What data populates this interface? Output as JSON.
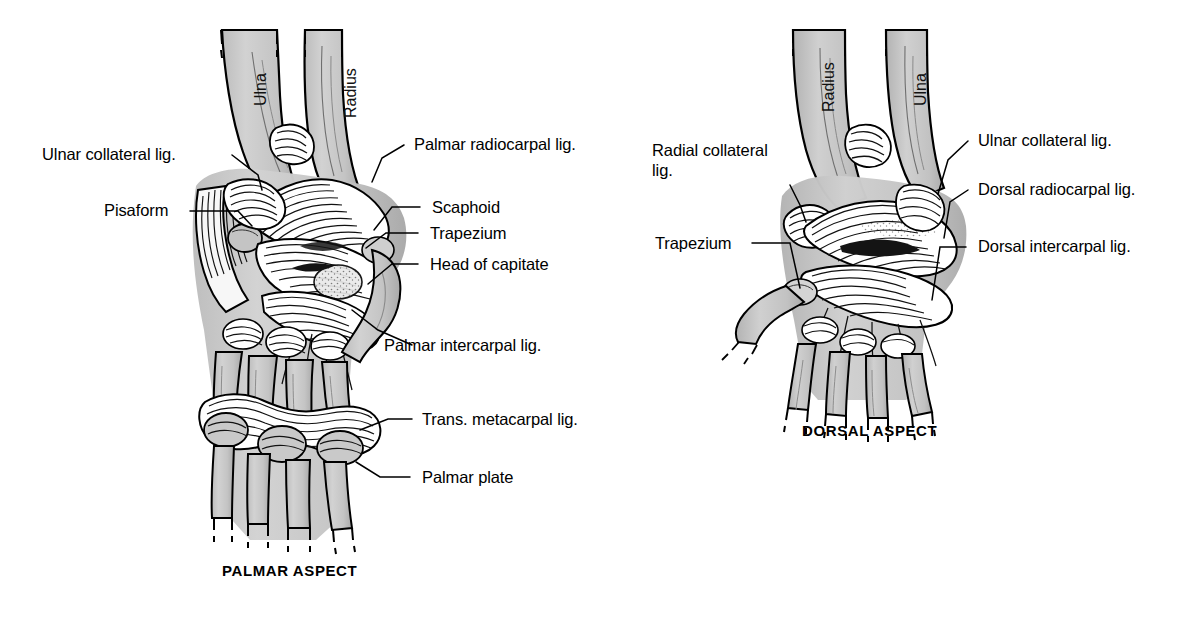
{
  "figure": {
    "background_color": "#ffffff",
    "bone_fill_color": "#c9c9c9",
    "ink_color": "#000000"
  },
  "panels": [
    {
      "id": "palmar",
      "caption": "PALMAR ASPECT",
      "bone_labels": [
        {
          "name": "ulna-label",
          "text": "Ulna"
        },
        {
          "name": "radius-label",
          "text": "Radius"
        }
      ],
      "labels_left": [
        {
          "name": "label-ulnar-collateral-lig",
          "text": "Ulnar collateral lig."
        },
        {
          "name": "label-pisiform",
          "text": "Pisaform"
        }
      ],
      "labels_right": [
        {
          "name": "label-palmar-radiocarpal-lig",
          "text": "Palmar radiocarpal lig."
        },
        {
          "name": "label-scaphoid",
          "text": "Scaphoid"
        },
        {
          "name": "label-trapezium",
          "text": "Trapezium"
        },
        {
          "name": "label-head-of-capitate",
          "text": "Head of capitate"
        },
        {
          "name": "label-palmar-intercarpal-lig",
          "text": "Palmar intercarpal lig."
        },
        {
          "name": "label-trans-metacarpal-lig",
          "text": "Trans. metacarpal lig."
        },
        {
          "name": "label-palmar-plate",
          "text": "Palmar plate"
        }
      ]
    },
    {
      "id": "dorsal",
      "caption": "DORSAL ASPECT",
      "bone_labels": [
        {
          "name": "radius-label",
          "text": "Radius"
        },
        {
          "name": "ulna-label",
          "text": "Ulna"
        }
      ],
      "labels_left": [
        {
          "name": "label-radial-collateral-lig",
          "text": "Radial collateral lig."
        },
        {
          "name": "label-trapezium",
          "text": "Trapezium"
        }
      ],
      "labels_right": [
        {
          "name": "label-ulnar-collateral-lig",
          "text": "Ulnar collateral lig."
        },
        {
          "name": "label-dorsal-radiocarpal-lig",
          "text": "Dorsal radiocarpal lig."
        },
        {
          "name": "label-dorsal-intercarpal-lig",
          "text": "Dorsal intercarpal lig."
        }
      ]
    }
  ]
}
